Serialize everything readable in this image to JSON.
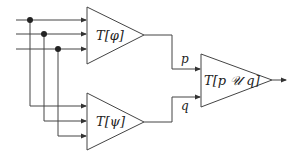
{
  "diagram": {
    "type": "circuit-composition",
    "colors": {
      "stroke": "#444444",
      "text": "#222222",
      "background": "#ffffff"
    },
    "inputs": [
      {
        "id": "in1"
      },
      {
        "id": "in2"
      },
      {
        "id": "in3"
      }
    ],
    "gates": [
      {
        "id": "top",
        "label": "T[φ]"
      },
      {
        "id": "bottom",
        "label": "T[ψ]"
      },
      {
        "id": "combine",
        "label": "T[p 𝒰 q]"
      }
    ],
    "signals": [
      {
        "id": "p",
        "label": "p"
      },
      {
        "id": "q",
        "label": "q"
      }
    ]
  }
}
